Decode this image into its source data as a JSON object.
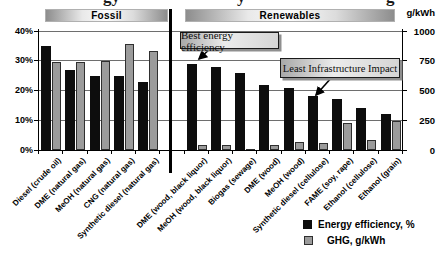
{
  "top_edge_fragments": {
    "note": "partially cropped chart title, only letter descenders visible",
    "items": [
      {
        "text": "gy",
        "x": 103
      },
      {
        "text": "y",
        "x": 237
      },
      {
        "text": "g",
        "x": 386
      }
    ]
  },
  "header": {
    "fossil": "Fossil",
    "renewables": "Renewables",
    "unit_label": "g/kWh"
  },
  "annotations": {
    "best_efficiency": "Best energy efficiency",
    "least_infrastructure": "Least Infrastructure Impact"
  },
  "legend": {
    "items": [
      {
        "label": "Energy efficiency, %",
        "swatch": "#0d0d0d"
      },
      {
        "label": "GHG, g/kWh",
        "swatch": "#9b9b9b"
      }
    ]
  },
  "axes": {
    "left": {
      "ticks": [
        "40%",
        "30%",
        "20%",
        "10%",
        "0%"
      ],
      "values": [
        40,
        30,
        20,
        10,
        0
      ]
    },
    "right": {
      "ticks": [
        "1000",
        "750",
        "500",
        "250",
        "0"
      ],
      "values": [
        1000,
        750,
        500,
        250,
        0
      ]
    }
  },
  "chart_data": {
    "type": "bar",
    "categories": [
      "Diesel (crude oil)",
      "DME (natural gas)",
      "MeOH (natural gas)",
      "CNG (natural gas)",
      "Synthetic diesel (natural gas)",
      "DME (wood, black liquor)",
      "MeOH (wood, black liquor)",
      "Biogas (sewage)",
      "DME (wood)",
      "MeOH (wood)",
      "Synthetic diesel (cellulose)",
      "FAME (soy, rape)",
      "Ethanol (cellulose)",
      "Ethanol (grain)"
    ],
    "category_groups": [
      {
        "label": "Fossil",
        "count": 5
      },
      {
        "label": "Renewables",
        "count": 9
      }
    ],
    "series": [
      {
        "name": "Energy efficiency, %",
        "axis": "left",
        "unit": "%",
        "color": "#0d0d0d",
        "values": [
          35,
          27,
          25,
          25,
          23,
          29,
          28,
          26,
          22,
          21,
          18,
          17,
          14,
          12
        ]
      },
      {
        "name": "GHG, g/kWh",
        "axis": "right",
        "unit": "g/kWh",
        "color": "#9b9b9b",
        "values": [
          740,
          740,
          750,
          890,
          830,
          40,
          40,
          10,
          45,
          65,
          60,
          230,
          85,
          245
        ]
      }
    ],
    "left_axis": {
      "min": 0,
      "max": 40,
      "unit": "%",
      "ticks": [
        0,
        10,
        20,
        30,
        40
      ]
    },
    "right_axis": {
      "min": 0,
      "max": 1000,
      "unit": "g/kWh",
      "ticks": [
        0,
        250,
        500,
        750,
        1000
      ]
    },
    "grid": "horizontal",
    "legend_position": "bottom-right",
    "annotations": [
      {
        "text": "Best energy efficiency",
        "points_to": "DME (wood, black liquor)"
      },
      {
        "text": "Least Infrastructure Impact",
        "points_to": "Synthetic diesel (cellulose)"
      }
    ]
  }
}
